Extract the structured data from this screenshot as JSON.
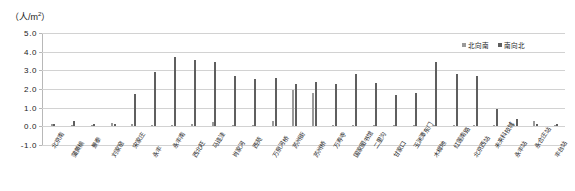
{
  "chart_data": {
    "type": "bar",
    "title": "",
    "subtitle": "",
    "xlabel": "",
    "ylabel": "（人/m²）",
    "ylim": [
      -1.0,
      5.0
    ],
    "ytick_labels": [
      "5.0",
      "4.0",
      "3.0",
      "2.0",
      "1.0",
      "0.0",
      "-1.0"
    ],
    "ytick_values": [
      5.0,
      4.0,
      3.0,
      2.0,
      1.0,
      0.0,
      -1.0
    ],
    "grid": true,
    "legend_position": "top-right",
    "categories": [
      "北京南",
      "蒲黄榆",
      "景泰",
      "刘家窑",
      "宋家庄",
      "永丰",
      "永丰南",
      "西北旺",
      "马连洼",
      "肖家河",
      "西苑",
      "万泉河桥",
      "苏州街",
      "苏州桥",
      "万寿寺",
      "国家图书馆",
      "二里沟",
      "甘家口",
      "玉渊潭东门",
      "木樨地",
      "红莲南路",
      "北京西站",
      "未来科技城",
      "永丰站",
      "永合庄站",
      "丰台站"
    ],
    "series": [
      {
        "name": "北向南",
        "color": "#9a9a9a",
        "values": [
          0.1,
          0.05,
          0.05,
          0.18,
          0.12,
          0.05,
          0.05,
          0.1,
          0.25,
          0.08,
          0.06,
          0.3,
          1.95,
          1.8,
          0.05,
          0.05,
          0.06,
          0.05,
          0.05,
          0.05,
          0.05,
          0.05,
          0.05,
          0.06,
          0.3,
          0.05
        ]
      },
      {
        "name": "南向北",
        "color": "#5f5f5f",
        "values": [
          0.1,
          0.3,
          0.1,
          0.1,
          1.75,
          2.9,
          3.7,
          3.55,
          3.45,
          2.7,
          2.55,
          2.6,
          2.25,
          2.35,
          2.25,
          2.8,
          2.3,
          1.7,
          1.8,
          3.45,
          2.8,
          2.7,
          0.95,
          0.4,
          0.1,
          0.1
        ]
      }
    ]
  },
  "legend": {
    "items": [
      {
        "label": "北向南"
      },
      {
        "label": "南向北"
      }
    ]
  },
  "axis": {
    "unit_prefix": "（人/m",
    "unit_exponent": "2",
    "unit_suffix": "）"
  }
}
